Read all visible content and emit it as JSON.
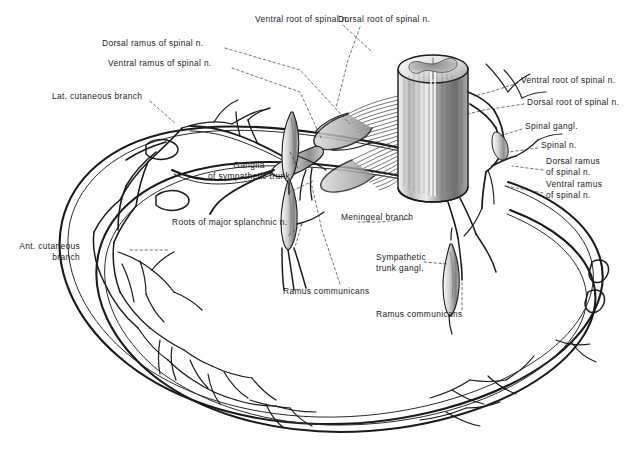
{
  "figure": {
    "background_color": "#ffffff",
    "ink_color": "#1a1a1a",
    "line_style": "pen-and-ink engraving, dashed leader lines"
  },
  "labels": [
    {
      "id": "ventral-root-top",
      "text": "Ventral root of spinal n.",
      "x": 255,
      "y": 19,
      "align": "left"
    },
    {
      "id": "dorsal-root-top",
      "text": "Dorsal root of spinal n.",
      "x": 338,
      "y": 19,
      "align": "left"
    },
    {
      "id": "dorsal-ramus-left",
      "text": "Dorsal ramus of spinal n.",
      "x": 102,
      "y": 42,
      "align": "left"
    },
    {
      "id": "ventral-ramus-left",
      "text": "Ventral ramus of spinal n.",
      "x": 108,
      "y": 62,
      "align": "left"
    },
    {
      "id": "lat-cutaneous",
      "text": "Lat. cutaneous branch",
      "x": 52,
      "y": 95,
      "align": "left"
    },
    {
      "id": "ventral-root-right",
      "text": "Ventral root of spinal n.",
      "x": 521,
      "y": 79,
      "align": "left"
    },
    {
      "id": "dorsal-root-right",
      "text": "Dorsal root of spinal n.",
      "x": 527,
      "y": 101,
      "align": "left"
    },
    {
      "id": "spinal-gangl",
      "text": "Spinal gangl.",
      "x": 525,
      "y": 125,
      "align": "left"
    },
    {
      "id": "spinal-n",
      "text": "Spinal n.",
      "x": 541,
      "y": 144,
      "align": "left"
    },
    {
      "id": "dorsal-ramus-right",
      "text": "Dorsal ramus\nof spinal n.",
      "x": 546,
      "y": 160,
      "align": "left"
    },
    {
      "id": "ventral-ramus-right",
      "text": "Ventral ramus\nof spinal n.",
      "x": 546,
      "y": 183,
      "align": "left"
    },
    {
      "id": "ganglia-symp-trunk",
      "text": "Ganglia\nof sympathetic trunk",
      "x": 249,
      "y": 164,
      "align": "center"
    },
    {
      "id": "roots-splanchnic",
      "text": "Roots of major splanchnic n.",
      "x": 172,
      "y": 221,
      "align": "left"
    },
    {
      "id": "meningeal-branch",
      "text": "Meningeal branch",
      "x": 341,
      "y": 216,
      "align": "left"
    },
    {
      "id": "ant-cutaneous",
      "text": "Ant. cutaneous\nbranch",
      "x": 80,
      "y": 245,
      "align": "right"
    },
    {
      "id": "ramus-communicans-1",
      "text": "Ramus communicans",
      "x": 283,
      "y": 290,
      "align": "left"
    },
    {
      "id": "sympathetic-trunk-gangl",
      "text": "Sympathetic\ntrunk gangl.",
      "x": 376,
      "y": 256,
      "align": "left"
    },
    {
      "id": "ramus-communicans-2",
      "text": "Ramus communicans",
      "x": 376,
      "y": 313,
      "align": "left"
    }
  ],
  "structures": [
    {
      "id": "spinal-cord",
      "name": "Spinal cord segment (cylinder with gray matter)"
    },
    {
      "id": "dorsal-rootlets",
      "name": "Dorsal rootlets fan"
    },
    {
      "id": "ventral-rootlets",
      "name": "Ventral rootlets fan"
    },
    {
      "id": "spinal-ganglion",
      "name": "Spinal (dorsal root) ganglion"
    },
    {
      "id": "sympathetic-ganglion-upper",
      "name": "Upper sympathetic trunk ganglion"
    },
    {
      "id": "sympathetic-ganglion-lower",
      "name": "Lower sympathetic trunk ganglion"
    },
    {
      "id": "sympathetic-ganglion-right",
      "name": "Right sympathetic trunk ganglion"
    },
    {
      "id": "intercostal-nerve-upper",
      "name": "Upper intercostal nerve ring"
    },
    {
      "id": "intercostal-nerve-lower",
      "name": "Lower intercostal nerve ring"
    },
    {
      "id": "cutaneous-branches",
      "name": "Cutaneous branch arborizations"
    }
  ]
}
